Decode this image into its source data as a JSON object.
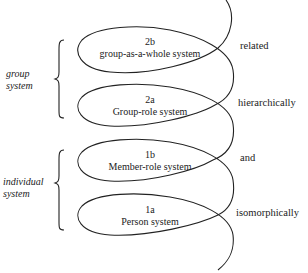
{
  "diagram": {
    "loops": [
      {
        "id": "2b",
        "number": "2b",
        "label": "group-as-a-whole system"
      },
      {
        "id": "2a",
        "number": "2a",
        "label": "Group-role system"
      },
      {
        "id": "1b",
        "number": "1b",
        "label": "Member-role system"
      },
      {
        "id": "1a",
        "number": "1a",
        "label": "Person system"
      }
    ],
    "relations": [
      "related",
      "hierarchically",
      "and",
      "isomorphically"
    ],
    "groupings": [
      {
        "id": "group",
        "line1": "group",
        "line2": "system",
        "covers": [
          "2b",
          "2a"
        ]
      },
      {
        "id": "individual",
        "line1": "individual",
        "line2": "system",
        "covers": [
          "1b",
          "1a"
        ]
      }
    ],
    "colors": {
      "stroke": "#222222",
      "background": "#ffffff"
    }
  }
}
